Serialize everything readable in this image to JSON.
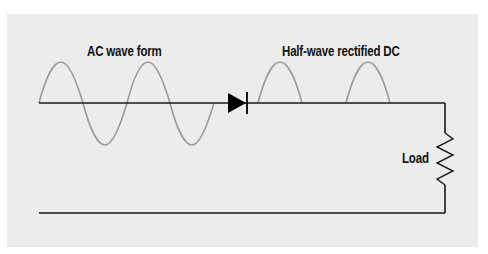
{
  "diagram": {
    "labels": {
      "ac_waveform": "AC wave form",
      "rectified": "Half-wave rectified DC",
      "load": "Load"
    },
    "colors": {
      "background": "#ececec",
      "wire": "#1a1a1a",
      "waveform": "#9a9a9a",
      "diode": "#000000",
      "text": "#111111"
    },
    "components": [
      {
        "type": "ac-source-waveform",
        "cycles": 2
      },
      {
        "type": "diode",
        "orientation": "forward"
      },
      {
        "type": "rectified-waveform",
        "humps": 2
      },
      {
        "type": "resistor",
        "label": "Load"
      }
    ]
  }
}
